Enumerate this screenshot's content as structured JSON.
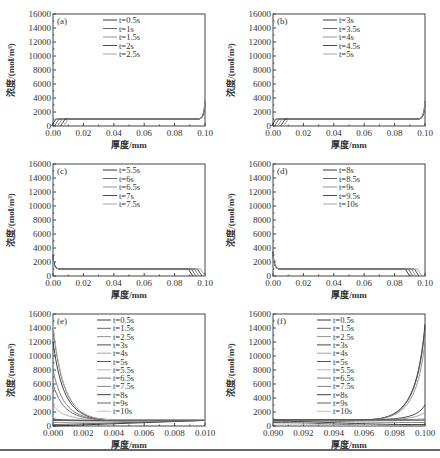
{
  "chart_data": [
    {
      "id": "a",
      "panel_label": "(a)",
      "type": "line",
      "xlabel": "厚度/mm",
      "ylabel": "浓度/(mol/m³)",
      "xlim": [
        0,
        0.1
      ],
      "ylim": [
        0,
        16000
      ],
      "xticks": [
        "0.00",
        "0.02",
        "0.04",
        "0.06",
        "0.08",
        "0.10"
      ],
      "yticks": [
        "0",
        "2000",
        "4000",
        "6000",
        "8000",
        "10000",
        "12000",
        "14000",
        "16000"
      ],
      "legend": [
        "t=0.5s",
        "t=1s",
        "t=1.5s",
        "t=2s",
        "t=2.5s"
      ],
      "series": [
        {
          "name": "t=0.5s",
          "front_x": 0.002,
          "plateau": 1000,
          "wall_peak": 3000
        },
        {
          "name": "t=1s",
          "front_x": 0.004,
          "plateau": 1000,
          "wall_peak": 3000
        },
        {
          "name": "t=1.5s",
          "front_x": 0.006,
          "plateau": 1000,
          "wall_peak": 3000
        },
        {
          "name": "t=2s",
          "front_x": 0.008,
          "plateau": 1000,
          "wall_peak": 3000
        },
        {
          "name": "t=2.5s",
          "front_x": 0.01,
          "plateau": 1000,
          "wall_peak": 3000
        }
      ],
      "notes": "Concentration rises near x=0 front and sharply at x=0.10"
    },
    {
      "id": "b",
      "panel_label": "(b)",
      "type": "line",
      "xlabel": "厚度/mm",
      "ylabel": "浓度/(mol/m³)",
      "xlim": [
        0,
        0.1
      ],
      "ylim": [
        0,
        16000
      ],
      "xticks": [
        "0.00",
        "0.02",
        "0.04",
        "0.06",
        "0.08",
        "0.10"
      ],
      "yticks": [
        "0",
        "2000",
        "4000",
        "6000",
        "8000",
        "10000",
        "12000",
        "14000",
        "16000"
      ],
      "legend": [
        "t=3s",
        "t=3.5s",
        "t=4s",
        "t=4.5s",
        "t=5s"
      ],
      "series": [
        {
          "name": "t=3s",
          "front_x": 0.002,
          "plateau": 1000,
          "wall_peak": 3000
        },
        {
          "name": "t=3.5s",
          "front_x": 0.004,
          "plateau": 1000,
          "wall_peak": 3000
        },
        {
          "name": "t=4s",
          "front_x": 0.006,
          "plateau": 1000,
          "wall_peak": 3000
        },
        {
          "name": "t=4.5s",
          "front_x": 0.008,
          "plateau": 1000,
          "wall_peak": 3000
        },
        {
          "name": "t=5s",
          "front_x": 0.01,
          "plateau": 1000,
          "wall_peak": 3000
        }
      ]
    },
    {
      "id": "c",
      "panel_label": "(c)",
      "type": "line",
      "xlabel": "厚度/mm",
      "ylabel": "浓度/(mol/m³)",
      "xlim": [
        0,
        0.1
      ],
      "ylim": [
        0,
        16000
      ],
      "xticks": [
        "0.00",
        "0.02",
        "0.04",
        "0.06",
        "0.08",
        "0.10"
      ],
      "yticks": [
        "0",
        "2000",
        "4000",
        "6000",
        "8000",
        "10000",
        "12000",
        "14000",
        "16000"
      ],
      "legend": [
        "t=5.5s",
        "t=6s",
        "t=6.5s",
        "t=7s",
        "t=7.5s"
      ],
      "series": [
        {
          "name": "t=5.5s",
          "front_x": 0.092,
          "plateau": 1000,
          "wall_peak": 3000
        },
        {
          "name": "t=6s",
          "front_x": 0.094,
          "plateau": 1000,
          "wall_peak": 3000
        },
        {
          "name": "t=6.5s",
          "front_x": 0.096,
          "plateau": 1000,
          "wall_peak": 3000
        },
        {
          "name": "t=7s",
          "front_x": 0.098,
          "plateau": 1000,
          "wall_peak": 3000
        },
        {
          "name": "t=7.5s",
          "front_x": 0.1,
          "plateau": 1000,
          "wall_peak": 3000
        }
      ]
    },
    {
      "id": "d",
      "panel_label": "(d)",
      "type": "line",
      "xlabel": "厚度/mm",
      "ylabel": "浓度/(mol/m³)",
      "xlim": [
        0,
        0.1
      ],
      "ylim": [
        0,
        16000
      ],
      "xticks": [
        "0.00",
        "0.02",
        "0.04",
        "0.06",
        "0.08",
        "0.10"
      ],
      "yticks": [
        "0",
        "2000",
        "4000",
        "6000",
        "8000",
        "10000",
        "12000",
        "14000",
        "16000"
      ],
      "legend": [
        "t=8s",
        "t=8.5s",
        "t=9s",
        "t=9.5s",
        "t=10s"
      ],
      "series": [
        {
          "name": "t=8s",
          "front_x": 0.09,
          "plateau": 1000,
          "wall_peak": 3500
        },
        {
          "name": "t=8.5s",
          "front_x": 0.092,
          "plateau": 1000,
          "wall_peak": 3500
        },
        {
          "name": "t=9s",
          "front_x": 0.094,
          "plateau": 1000,
          "wall_peak": 3500
        },
        {
          "name": "t=9.5s",
          "front_x": 0.096,
          "plateau": 1000,
          "wall_peak": 3500
        },
        {
          "name": "t=10s",
          "front_x": 0.098,
          "plateau": 1000,
          "wall_peak": 3500
        }
      ]
    },
    {
      "id": "e",
      "panel_label": "(e)",
      "type": "line",
      "xlabel": "厚度/mm",
      "ylabel": "浓度/(mol/m³)",
      "xlim": [
        0,
        0.01
      ],
      "ylim": [
        0,
        16000
      ],
      "xticks": [
        "0.000",
        "0.002",
        "0.004",
        "0.006",
        "0.008",
        "0.010"
      ],
      "yticks": [
        "0",
        "2000",
        "4000",
        "6000",
        "8000",
        "10000",
        "12000",
        "14000",
        "16000"
      ],
      "legend": [
        "t=0.5s",
        "t=1.5s",
        "t=2.5s",
        "t=3s",
        "t=4s",
        "t=5s",
        "t=5.5s",
        "t=6.5s",
        "t=7.5s",
        "t=8s",
        "t=9s",
        "t=10s"
      ],
      "series": [
        {
          "name": "t=0.5s",
          "y_at_0": 0,
          "y_at_end": 800
        },
        {
          "name": "t=1.5s",
          "y_at_0": 200,
          "y_at_end": 800
        },
        {
          "name": "t=2.5s",
          "y_at_0": 500,
          "y_at_end": 800
        },
        {
          "name": "t=3s",
          "y_at_0": 800,
          "y_at_end": 800
        },
        {
          "name": "t=4s",
          "y_at_0": 1000,
          "y_at_end": 800
        },
        {
          "name": "t=5s",
          "y_at_0": 1000,
          "y_at_end": 800
        },
        {
          "name": "t=5.5s",
          "y_at_0": 3000,
          "y_at_end": 900
        },
        {
          "name": "t=6.5s",
          "y_at_0": 6000,
          "y_at_end": 900
        },
        {
          "name": "t=7.5s",
          "y_at_0": 8000,
          "y_at_end": 900
        },
        {
          "name": "t=8s",
          "y_at_0": 12000,
          "y_at_end": 900
        },
        {
          "name": "t=9s",
          "y_at_0": 14000,
          "y_at_end": 900
        },
        {
          "name": "t=10s",
          "y_at_0": 14500,
          "y_at_end": 900
        }
      ]
    },
    {
      "id": "f",
      "panel_label": "(f)",
      "type": "line",
      "xlabel": "厚度/mm",
      "ylabel": "浓度/(mol/m³)",
      "xlim": [
        0.09,
        0.1
      ],
      "ylim": [
        0,
        16000
      ],
      "xticks": [
        "0.090",
        "0.092",
        "0.094",
        "0.096",
        "0.098",
        "0.100"
      ],
      "yticks": [
        "0",
        "2000",
        "4000",
        "6000",
        "8000",
        "10000",
        "12000",
        "14000",
        "16000"
      ],
      "legend": [
        "t=0.5s",
        "t=1.5s",
        "t=2.5s",
        "t=3s",
        "t=4s",
        "t=5s",
        "t=5.5s",
        "t=6.5s",
        "t=7.5s",
        "t=8s",
        "t=9s",
        "t=10s"
      ],
      "series": [
        {
          "name": "t=0.5s",
          "y_at_start": 900,
          "y_at_end": 14500
        },
        {
          "name": "t=1.5s",
          "y_at_start": 900,
          "y_at_end": 14000
        },
        {
          "name": "t=2.5s",
          "y_at_start": 900,
          "y_at_end": 12000
        },
        {
          "name": "t=3s",
          "y_at_start": 900,
          "y_at_end": 3000
        },
        {
          "name": "t=4s",
          "y_at_start": 900,
          "y_at_end": 2000
        },
        {
          "name": "t=5s",
          "y_at_start": 900,
          "y_at_end": 1000
        },
        {
          "name": "t=5.5s",
          "y_at_start": 800,
          "y_at_end": 1000
        },
        {
          "name": "t=6.5s",
          "y_at_start": 800,
          "y_at_end": 800
        },
        {
          "name": "t=7.5s",
          "y_at_start": 800,
          "y_at_end": 500
        },
        {
          "name": "t=8s",
          "y_at_start": 700,
          "y_at_end": 200
        },
        {
          "name": "t=9s",
          "y_at_start": 500,
          "y_at_end": 0
        },
        {
          "name": "t=10s",
          "y_at_start": 300,
          "y_at_end": 0
        }
      ]
    }
  ]
}
